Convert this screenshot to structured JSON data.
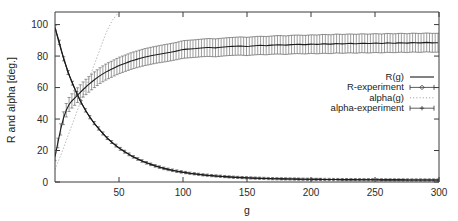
{
  "chart_data": {
    "type": "line",
    "title": "",
    "subtitle": "",
    "xlabel": "g",
    "ylabel": "R  and  alpha [deg.]",
    "xlim": [
      0,
      300
    ],
    "ylim": [
      0,
      108
    ],
    "xticks": [
      50,
      100,
      150,
      200,
      250,
      300
    ],
    "yticks": [
      0,
      20,
      40,
      60,
      80,
      100
    ],
    "xtick_labels": [
      "50",
      "100",
      "150",
      "200",
      "250",
      "300"
    ],
    "ytick_labels": [
      "0",
      "20",
      "40",
      "60",
      "80",
      "100"
    ],
    "grid": false,
    "legend_position": "right-middle",
    "legend_entries": [
      {
        "label": "R(g)",
        "key": "solid-line"
      },
      {
        "label": "R-experiment",
        "key": "errorbar-diamond"
      },
      {
        "label": "alpha(g)",
        "key": "dotted-line"
      },
      {
        "label": "alpha-experiment",
        "key": "errorbar-plus"
      }
    ],
    "series": [
      {
        "name": "R(g)",
        "style": "solid-line",
        "x": [
          0,
          2,
          4,
          6,
          8,
          10,
          12,
          15,
          18,
          21,
          25,
          30,
          35,
          40,
          45,
          50,
          60,
          70,
          80,
          90,
          100,
          110,
          120,
          130,
          140,
          150,
          160,
          170,
          180,
          190,
          200,
          220,
          240,
          260,
          280,
          300
        ],
        "values": [
          98,
          92,
          86,
          80.5,
          75.5,
          70.5,
          66,
          60,
          54.5,
          49.5,
          44,
          38,
          33,
          28.5,
          24.8,
          21.6,
          16.4,
          12.6,
          9.8,
          7.7,
          6.1,
          5.0,
          4.1,
          3.5,
          3.0,
          2.6,
          2.3,
          2.1,
          1.95,
          1.8,
          1.7,
          1.55,
          1.45,
          1.35,
          1.3,
          1.25
        ]
      },
      {
        "name": "R-experiment",
        "style": "errorbar-diamond",
        "x": [
          0,
          3,
          6,
          9,
          12,
          15,
          18,
          22,
          26,
          30,
          35,
          40,
          45,
          50,
          56,
          62,
          70,
          78,
          86,
          95,
          105,
          115,
          125,
          140,
          155,
          170,
          185,
          200,
          220,
          240,
          260,
          280,
          300
        ],
        "values": [
          98,
          90,
          80.5,
          72,
          66,
          60,
          54.5,
          48,
          42.5,
          38,
          33,
          28.5,
          24.8,
          21.6,
          18.4,
          15.6,
          12.6,
          10.3,
          8.4,
          6.9,
          5.6,
          4.6,
          3.9,
          3.0,
          2.5,
          2.1,
          1.9,
          1.7,
          1.55,
          1.45,
          1.35,
          1.3,
          1.25
        ],
        "yerr": [
          1.4,
          1.4,
          1.3,
          1.3,
          1.2,
          1.2,
          1.1,
          1.1,
          1.0,
          1.0,
          1.0,
          0.9,
          0.9,
          0.9,
          0.9,
          0.8,
          0.8,
          0.8,
          0.8,
          0.8,
          0.7,
          0.7,
          0.7,
          0.7,
          0.7,
          0.7,
          0.7,
          0.7,
          0.7,
          0.7,
          0.7,
          0.7,
          0.7
        ]
      },
      {
        "name": "alpha(g)",
        "style": "dotted-line",
        "x": [
          0,
          5,
          10,
          15,
          20,
          25,
          30,
          35,
          40,
          45,
          50
        ],
        "values": [
          8,
          18,
          29,
          40,
          51,
          62,
          73,
          84,
          95,
          103,
          108
        ]
      },
      {
        "name": "alpha-experiment",
        "style": "errorbar-plus",
        "x": [
          0,
          2,
          4,
          6,
          8,
          10,
          12,
          15,
          18,
          21,
          25,
          30,
          35,
          40,
          45,
          50,
          55,
          60,
          65,
          70,
          75,
          80,
          85,
          90,
          95,
          100,
          105,
          110,
          115,
          120,
          125,
          130,
          135,
          140,
          145,
          150,
          155,
          160,
          165,
          170,
          175,
          180,
          185,
          190,
          195,
          200,
          205,
          210,
          215,
          220,
          225,
          230,
          235,
          240,
          245,
          250,
          255,
          260,
          265,
          270,
          275,
          280,
          285,
          290,
          295,
          300
        ],
        "values": [
          16,
          24,
          32,
          39,
          44,
          48,
          50.5,
          53,
          55.5,
          58,
          61,
          64.5,
          67.5,
          70,
          72,
          74,
          75.5,
          77,
          78.2,
          79.3,
          80.2,
          81,
          81.7,
          82.4,
          83.2,
          84.2,
          84.5,
          84.8,
          85.2,
          85.5,
          85.2,
          85.6,
          86,
          86.2,
          86.4,
          86.1,
          86.5,
          86.8,
          86.6,
          87,
          87.2,
          86.9,
          87.3,
          87.5,
          87.2,
          87.6,
          87.4,
          87.8,
          87.5,
          88,
          87.7,
          88.1,
          87.8,
          88.2,
          87.9,
          88.3,
          88,
          88.4,
          88.1,
          88.5,
          88.2,
          88.6,
          88.3,
          88.7,
          88.4,
          88.5
        ],
        "yerr": [
          2.5,
          3.0,
          3.5,
          4.0,
          4.2,
          4.4,
          4.5,
          4.6,
          4.7,
          4.8,
          4.9,
          5.0,
          5.0,
          5.1,
          5.1,
          5.2,
          5.2,
          5.3,
          5.3,
          5.4,
          5.4,
          5.4,
          5.5,
          5.5,
          5.5,
          5.6,
          5.6,
          5.6,
          5.6,
          5.7,
          5.7,
          5.7,
          5.7,
          5.7,
          5.8,
          5.8,
          5.8,
          5.8,
          5.8,
          5.8,
          5.9,
          5.9,
          5.9,
          5.9,
          5.9,
          5.9,
          6.0,
          6.0,
          6.0,
          6.0,
          6.0,
          6.0,
          6.0,
          6.0,
          6.0,
          6.0,
          6.0,
          6.0,
          6.0,
          6.0,
          6.0,
          6.0,
          6.0,
          6.0,
          6.0,
          6.0
        ]
      }
    ]
  },
  "colors": {
    "axis": "#3a3a3a",
    "solid_series": "#1c1c1c",
    "dotted_series": "#8c8c8c",
    "errorbar": "#4a4a4a",
    "background": "#ffffff"
  }
}
